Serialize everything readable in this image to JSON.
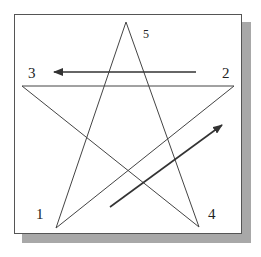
{
  "diagram": {
    "labels": {
      "v1": "1",
      "v2": "2",
      "v3": "3",
      "v4": "4",
      "v5": "5"
    },
    "stroke_color": "#333333",
    "shadow_color": "#a8a8a8"
  }
}
